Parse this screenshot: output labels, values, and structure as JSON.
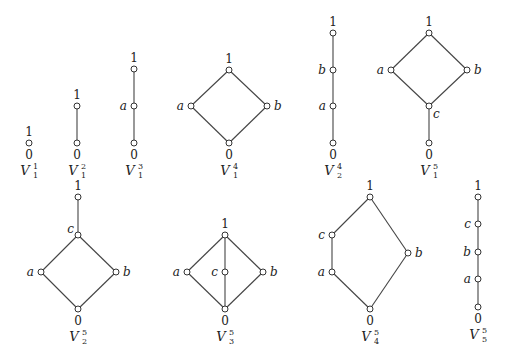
{
  "diagrams": [
    {
      "id": "V1_1",
      "name": "V",
      "sup": "1",
      "sub": "1",
      "label_pos": [
        29,
        175
      ],
      "nodes": [
        {
          "id": "1",
          "label": "1",
          "x": 29,
          "y": 143,
          "lx": 29,
          "ly": 136,
          "anchor": "middle"
        },
        {
          "id": "0",
          "label": "0",
          "x": 29,
          "y": 143,
          "lx": 29,
          "ly": 159,
          "anchor": "middle"
        }
      ],
      "edges": []
    },
    {
      "id": "V1_2",
      "name": "V",
      "sup": "2",
      "sub": "1",
      "label_pos": [
        77,
        175
      ],
      "nodes": [
        {
          "id": "1",
          "label": "1",
          "x": 77,
          "y": 106,
          "lx": 77,
          "ly": 99,
          "anchor": "middle"
        },
        {
          "id": "0",
          "label": "0",
          "x": 77,
          "y": 143,
          "lx": 77,
          "ly": 159,
          "anchor": "middle"
        }
      ],
      "edges": [
        [
          "1",
          "0"
        ]
      ]
    },
    {
      "id": "V1_3",
      "name": "V",
      "sup": "3",
      "sub": "1",
      "label_pos": [
        134,
        175
      ],
      "nodes": [
        {
          "id": "1",
          "label": "1",
          "x": 134,
          "y": 69,
          "lx": 134,
          "ly": 62,
          "anchor": "middle"
        },
        {
          "id": "a",
          "label": "a",
          "x": 134,
          "y": 106,
          "lx": 127,
          "ly": 110,
          "anchor": "end"
        },
        {
          "id": "0",
          "label": "0",
          "x": 134,
          "y": 143,
          "lx": 134,
          "ly": 159,
          "anchor": "middle"
        }
      ],
      "edges": [
        [
          "1",
          "a"
        ],
        [
          "a",
          "0"
        ]
      ]
    },
    {
      "id": "V1_4",
      "name": "V",
      "sup": "4",
      "sub": "1",
      "label_pos": [
        229,
        175
      ],
      "nodes": [
        {
          "id": "1",
          "label": "1",
          "x": 229,
          "y": 70,
          "lx": 229,
          "ly": 63,
          "anchor": "middle"
        },
        {
          "id": "a",
          "label": "a",
          "x": 191,
          "y": 106,
          "lx": 184,
          "ly": 110,
          "anchor": "end"
        },
        {
          "id": "b",
          "label": "b",
          "x": 267,
          "y": 106,
          "lx": 274,
          "ly": 110,
          "anchor": "start"
        },
        {
          "id": "0",
          "label": "0",
          "x": 229,
          "y": 143,
          "lx": 229,
          "ly": 159,
          "anchor": "middle"
        }
      ],
      "edges": [
        [
          "1",
          "a"
        ],
        [
          "1",
          "b"
        ],
        [
          "a",
          "0"
        ],
        [
          "b",
          "0"
        ]
      ]
    },
    {
      "id": "V2_4",
      "name": "V",
      "sup": "4",
      "sub": "2",
      "label_pos": [
        333,
        175
      ],
      "nodes": [
        {
          "id": "1",
          "label": "1",
          "x": 333,
          "y": 33,
          "lx": 333,
          "ly": 26,
          "anchor": "middle"
        },
        {
          "id": "b",
          "label": "b",
          "x": 333,
          "y": 70,
          "lx": 326,
          "ly": 74,
          "anchor": "end"
        },
        {
          "id": "a",
          "label": "a",
          "x": 333,
          "y": 106,
          "lx": 326,
          "ly": 110,
          "anchor": "end"
        },
        {
          "id": "0",
          "label": "0",
          "x": 333,
          "y": 143,
          "lx": 333,
          "ly": 159,
          "anchor": "middle"
        }
      ],
      "edges": [
        [
          "1",
          "b"
        ],
        [
          "b",
          "a"
        ],
        [
          "a",
          "0"
        ]
      ]
    },
    {
      "id": "V1_5",
      "name": "V",
      "sup": "5",
      "sub": "1",
      "label_pos": [
        429,
        175
      ],
      "nodes": [
        {
          "id": "1",
          "label": "1",
          "x": 429,
          "y": 33,
          "lx": 429,
          "ly": 26,
          "anchor": "middle"
        },
        {
          "id": "a",
          "label": "a",
          "x": 391,
          "y": 70,
          "lx": 384,
          "ly": 74,
          "anchor": "end"
        },
        {
          "id": "b",
          "label": "b",
          "x": 467,
          "y": 70,
          "lx": 474,
          "ly": 74,
          "anchor": "start"
        },
        {
          "id": "c",
          "label": "c",
          "x": 429,
          "y": 106,
          "lx": 433,
          "ly": 118,
          "anchor": "start"
        },
        {
          "id": "0",
          "label": "0",
          "x": 429,
          "y": 143,
          "lx": 429,
          "ly": 159,
          "anchor": "middle"
        }
      ],
      "edges": [
        [
          "1",
          "a"
        ],
        [
          "1",
          "b"
        ],
        [
          "a",
          "c"
        ],
        [
          "b",
          "c"
        ],
        [
          "c",
          "0"
        ]
      ]
    },
    {
      "id": "V2_5",
      "name": "V",
      "sup": "5",
      "sub": "2",
      "label_pos": [
        78,
        341
      ],
      "nodes": [
        {
          "id": "1",
          "label": "1",
          "x": 78,
          "y": 197,
          "lx": 78,
          "ly": 190,
          "anchor": "middle"
        },
        {
          "id": "c",
          "label": "c",
          "x": 78,
          "y": 235,
          "lx": 74,
          "ly": 233,
          "anchor": "end"
        },
        {
          "id": "a",
          "label": "a",
          "x": 41,
          "y": 272,
          "lx": 34,
          "ly": 276,
          "anchor": "end"
        },
        {
          "id": "b",
          "label": "b",
          "x": 116,
          "y": 272,
          "lx": 123,
          "ly": 276,
          "anchor": "start"
        },
        {
          "id": "0",
          "label": "0",
          "x": 78,
          "y": 309,
          "lx": 78,
          "ly": 325,
          "anchor": "middle"
        }
      ],
      "edges": [
        [
          "1",
          "c"
        ],
        [
          "c",
          "a"
        ],
        [
          "c",
          "b"
        ],
        [
          "a",
          "0"
        ],
        [
          "b",
          "0"
        ]
      ]
    },
    {
      "id": "V3_5",
      "name": "V",
      "sup": "5",
      "sub": "3",
      "label_pos": [
        225,
        341
      ],
      "nodes": [
        {
          "id": "1",
          "label": "1",
          "x": 225,
          "y": 235,
          "lx": 225,
          "ly": 228,
          "anchor": "middle"
        },
        {
          "id": "a",
          "label": "a",
          "x": 187,
          "y": 272,
          "lx": 180,
          "ly": 276,
          "anchor": "end"
        },
        {
          "id": "c",
          "label": "c",
          "x": 225,
          "y": 272,
          "lx": 218,
          "ly": 276,
          "anchor": "end"
        },
        {
          "id": "b",
          "label": "b",
          "x": 263,
          "y": 272,
          "lx": 270,
          "ly": 276,
          "anchor": "start"
        },
        {
          "id": "0",
          "label": "0",
          "x": 225,
          "y": 309,
          "lx": 225,
          "ly": 325,
          "anchor": "middle"
        }
      ],
      "edges": [
        [
          "1",
          "a"
        ],
        [
          "1",
          "c"
        ],
        [
          "1",
          "b"
        ],
        [
          "a",
          "0"
        ],
        [
          "c",
          "0"
        ],
        [
          "b",
          "0"
        ]
      ]
    },
    {
      "id": "V4_5",
      "name": "V",
      "sup": "5",
      "sub": "4",
      "label_pos": [
        370,
        341
      ],
      "nodes": [
        {
          "id": "1",
          "label": "1",
          "x": 370,
          "y": 197,
          "lx": 370,
          "ly": 190,
          "anchor": "middle"
        },
        {
          "id": "c",
          "label": "c",
          "x": 332,
          "y": 235,
          "lx": 325,
          "ly": 239,
          "anchor": "end"
        },
        {
          "id": "a",
          "label": "a",
          "x": 332,
          "y": 272,
          "lx": 325,
          "ly": 276,
          "anchor": "end"
        },
        {
          "id": "b",
          "label": "b",
          "x": 408,
          "y": 253,
          "lx": 415,
          "ly": 257,
          "anchor": "start"
        },
        {
          "id": "0",
          "label": "0",
          "x": 370,
          "y": 309,
          "lx": 370,
          "ly": 325,
          "anchor": "middle"
        }
      ],
      "edges": [
        [
          "1",
          "c"
        ],
        [
          "c",
          "a"
        ],
        [
          "a",
          "0"
        ],
        [
          "1",
          "b"
        ],
        [
          "b",
          "0"
        ]
      ]
    },
    {
      "id": "V5_5",
      "name": "V",
      "sup": "5",
      "sub": "5",
      "label_pos": [
        478,
        339
      ],
      "nodes": [
        {
          "id": "1",
          "label": "1",
          "x": 478,
          "y": 197,
          "lx": 478,
          "ly": 190,
          "anchor": "middle"
        },
        {
          "id": "c",
          "label": "c",
          "x": 478,
          "y": 224,
          "lx": 471,
          "ly": 228,
          "anchor": "end"
        },
        {
          "id": "b",
          "label": "b",
          "x": 478,
          "y": 252,
          "lx": 471,
          "ly": 256,
          "anchor": "end"
        },
        {
          "id": "a",
          "label": "a",
          "x": 478,
          "y": 279,
          "lx": 471,
          "ly": 283,
          "anchor": "end"
        },
        {
          "id": "0",
          "label": "0",
          "x": 478,
          "y": 307,
          "lx": 478,
          "ly": 323,
          "anchor": "middle"
        }
      ],
      "edges": [
        [
          "1",
          "c"
        ],
        [
          "c",
          "b"
        ],
        [
          "b",
          "a"
        ],
        [
          "a",
          "0"
        ]
      ]
    }
  ]
}
